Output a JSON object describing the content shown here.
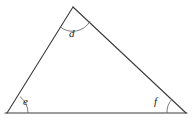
{
  "figure": {
    "type": "geometry-diagram",
    "shape": "triangle",
    "background_color": "#ffffff",
    "stroke_color": "#3b3b3b",
    "arc_color": "#6b6b6b",
    "label_color": "#1a1a1a",
    "stroke_width": 1.1,
    "canvas": {
      "width": 192,
      "height": 121
    }
  },
  "vertices": [
    {
      "name": "apex",
      "id": "A",
      "x": 73,
      "y": 7,
      "angle_label": "d"
    },
    {
      "name": "bottom-left",
      "id": "B",
      "x": 7,
      "y": 113,
      "angle_label": "e"
    },
    {
      "name": "bottom-right",
      "id": "C",
      "x": 186,
      "y": 113,
      "angle_label": "f"
    }
  ],
  "sides": [
    {
      "name": "left-side",
      "from": "B",
      "to": "A"
    },
    {
      "name": "right-side",
      "from": "A",
      "to": "C"
    },
    {
      "name": "base",
      "from": "B",
      "to": "C"
    }
  ],
  "angle_arcs": [
    {
      "name": "angle-arc-d",
      "vertex": "A",
      "radius": 20,
      "path": "M 60.2 26.9 A 20 20 0 0 0 90.1 21.2"
    },
    {
      "name": "angle-arc-e",
      "vertex": "B",
      "radius": 21,
      "path": "M 28 113 A 21 21 0 0 0 20.0 96.6"
    },
    {
      "name": "angle-arc-f",
      "vertex": "C",
      "radius": 19,
      "path": "M 172.1 99.1 A 19 19 0 0 0 167 113"
    }
  ],
  "labels": {
    "d": "d",
    "e": "e",
    "f": "f"
  }
}
